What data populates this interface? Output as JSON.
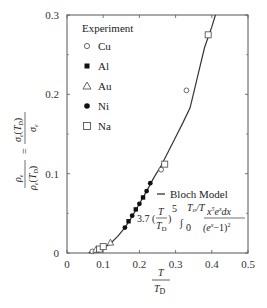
{
  "chart_data": {
    "type": "scatter",
    "title": "",
    "xlabel": "T / T_D",
    "ylabel": "ρe / ρe(T_D) = σe(T_D) / σe",
    "xlim": [
      0,
      0.5
    ],
    "ylim": [
      0,
      0.3
    ],
    "x_ticks": [
      "0",
      "0.1",
      "0.2",
      "0.3",
      "0.4",
      "0.5"
    ],
    "y_ticks": [
      "0",
      "0.1",
      "0.2",
      "0.3"
    ],
    "grid": false,
    "legend_title": "Experiment",
    "legend_position": "upper-left",
    "series": [
      {
        "name": "Cu",
        "marker": "open-circle",
        "points": [
          [
            0.07,
            0.002
          ],
          [
            0.26,
            0.105
          ],
          [
            0.33,
            0.205
          ]
        ]
      },
      {
        "name": "Al",
        "marker": "filled-square",
        "points": [
          [
            0.17,
            0.04
          ],
          [
            0.19,
            0.055
          ],
          [
            0.21,
            0.07
          ]
        ]
      },
      {
        "name": "Au",
        "marker": "open-triangle",
        "points": [
          [
            0.08,
            0.004
          ],
          [
            0.12,
            0.013
          ]
        ]
      },
      {
        "name": "Ni",
        "marker": "filled-circle",
        "points": [
          [
            0.16,
            0.032
          ],
          [
            0.18,
            0.047
          ],
          [
            0.2,
            0.062
          ],
          [
            0.22,
            0.078
          ],
          [
            0.23,
            0.088
          ]
        ]
      },
      {
        "name": "Na",
        "marker": "open-square",
        "points": [
          [
            0.09,
            0.005
          ],
          [
            0.1,
            0.008
          ],
          [
            0.27,
            0.112
          ],
          [
            0.39,
            0.275
          ]
        ]
      },
      {
        "name": "Bloch Model",
        "type": "line",
        "points": [
          [
            0.06,
            0.0005
          ],
          [
            0.08,
            0.002
          ],
          [
            0.1,
            0.006
          ],
          [
            0.12,
            0.012
          ],
          [
            0.14,
            0.021
          ],
          [
            0.16,
            0.032
          ],
          [
            0.18,
            0.046
          ],
          [
            0.2,
            0.062
          ],
          [
            0.22,
            0.078
          ],
          [
            0.24,
            0.095
          ],
          [
            0.26,
            0.11
          ],
          [
            0.28,
            0.128
          ],
          [
            0.3,
            0.146
          ],
          [
            0.32,
            0.164
          ],
          [
            0.34,
            0.183
          ],
          [
            0.36,
            0.221
          ],
          [
            0.38,
            0.259
          ],
          [
            0.4,
            0.285
          ],
          [
            0.41,
            0.3
          ]
        ]
      }
    ],
    "annotations": [
      "Bloch Model",
      "3.7 (T/T_D)^5 ∫_0^{T_D/T} x^5 e^x dx / (e^x − 1)^2"
    ]
  },
  "labels": {
    "legend_title": "Experiment",
    "legend": [
      "Cu",
      "Al",
      "Au",
      "Ni",
      "Na"
    ],
    "model_label": "Bloch Model",
    "formula_coef": "3.7",
    "x_ticks": [
      "0",
      "0.1",
      "0.2",
      "0.3",
      "0.4",
      "0.5"
    ],
    "y_ticks": [
      "0",
      "0.1",
      "0.2",
      "0.3"
    ]
  }
}
